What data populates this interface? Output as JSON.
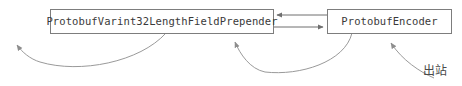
{
  "diagram": {
    "type": "flow-diagram",
    "background_color": "#ffffff",
    "nodes": [
      {
        "id": "prepender",
        "label": "ProtobufVarint32LengthFieldPrepender",
        "shape": "rectangle",
        "border_color": "#7d7d7d",
        "fill_color": "#ffffff",
        "text_color": "#3a3a3a",
        "x": 50,
        "y": 9,
        "width": 224,
        "height": 25
      },
      {
        "id": "encoder",
        "label": "ProtobufEncoder",
        "shape": "rectangle",
        "border_color": "#7d7d7d",
        "fill_color": "#ffffff",
        "text_color": "#3a3a3a",
        "x": 327,
        "y": 9,
        "width": 125,
        "height": 25
      }
    ],
    "edges": [
      {
        "id": "encoder-to-prepender",
        "from": "encoder",
        "to": "prepender",
        "style": "straight",
        "direction": "left",
        "color": "#6f6f6f",
        "y": 15
      },
      {
        "id": "prepender-to-encoder",
        "from": "prepender",
        "to": "encoder",
        "style": "straight",
        "direction": "right",
        "color": "#6f6f6f",
        "y": 27
      },
      {
        "id": "prepender-out-left",
        "from": "prepender",
        "to": "exit-left",
        "style": "curved",
        "direction": "up-left",
        "color": "#9a9a9a"
      },
      {
        "id": "encoder-to-prepender-curve",
        "from": "encoder",
        "to": "prepender",
        "style": "curved",
        "direction": "up-left",
        "color": "#9a9a9a"
      },
      {
        "id": "outbound-into-encoder",
        "from": "outbound-source",
        "to": "encoder",
        "style": "curved",
        "direction": "up",
        "color": "#9a9a9a"
      }
    ],
    "annotations": [
      {
        "id": "outbound",
        "text": "出站",
        "color": "#4a4a4a",
        "x": 423,
        "y": 65
      }
    ]
  }
}
